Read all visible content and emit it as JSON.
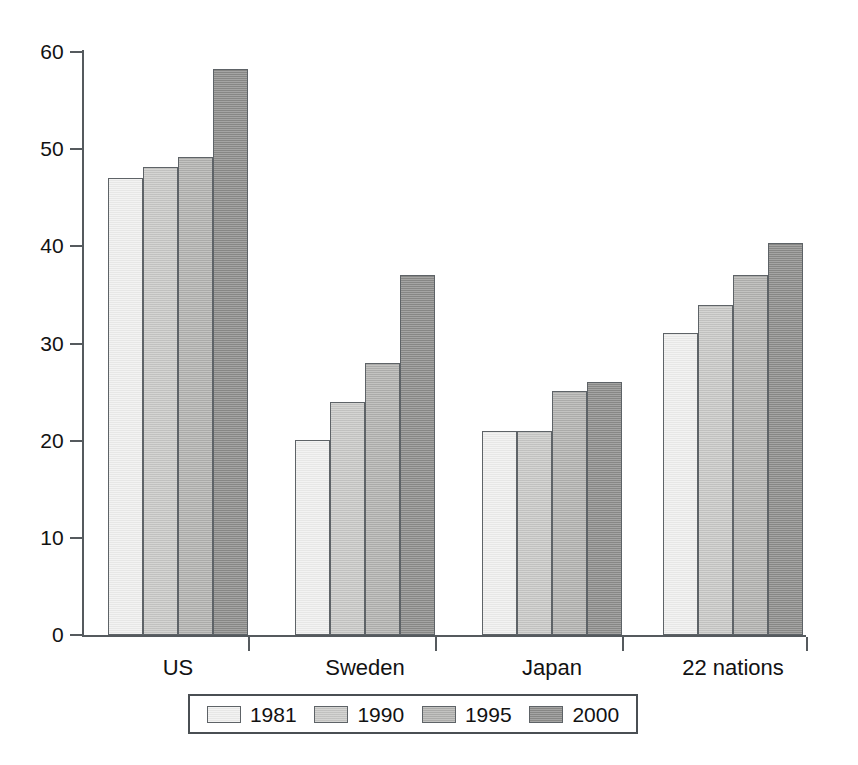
{
  "chart_data": {
    "type": "bar",
    "title": "",
    "subtitle": "",
    "xlabel": "",
    "ylabel": "",
    "categories": [
      "US",
      "Sweden",
      "Japan",
      "22 nations"
    ],
    "series": [
      {
        "name": "1981",
        "color": "#f0f0ef",
        "values": [
          47.0,
          20.1,
          21.0,
          31.1
        ]
      },
      {
        "name": "1990",
        "color": "#c9c9c7",
        "values": [
          48.2,
          24.0,
          21.0,
          34.0
        ]
      },
      {
        "name": "1995",
        "color": "#b2b2b0",
        "values": [
          49.2,
          28.0,
          25.1,
          37.0
        ]
      },
      {
        "name": "2000",
        "color": "#8c8c8a",
        "values": [
          58.2,
          37.0,
          26.0,
          40.3
        ]
      }
    ],
    "ylim": [
      0,
      60
    ],
    "ytick_labels": [
      "0",
      "10",
      "20",
      "30",
      "40",
      "50",
      "60"
    ],
    "ytick_values": [
      0,
      10,
      20,
      30,
      40,
      50,
      60
    ],
    "grid": false,
    "legend_position": "bottom",
    "axis_color": "#555a5e",
    "bar_edge_color": "#5e6367"
  },
  "legend": {
    "entries": [
      {
        "label": "1981"
      },
      {
        "label": "1990"
      },
      {
        "label": "1995"
      },
      {
        "label": "2000"
      }
    ]
  }
}
